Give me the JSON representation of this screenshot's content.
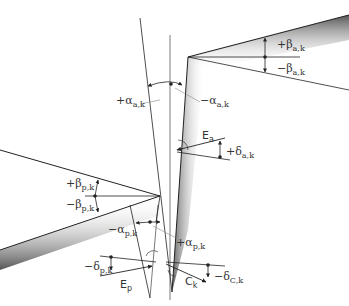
{
  "diagram": {
    "labels": {
      "beta_a_pos": {
        "sign": "+",
        "greek": "β",
        "sub": "a,k"
      },
      "beta_a_neg": {
        "sign": "−",
        "greek": "β",
        "sub": "a,k"
      },
      "alpha_a_pos": {
        "sign": "+",
        "greek": "α",
        "sub": "a,k"
      },
      "alpha_a_neg": {
        "sign": "−",
        "greek": "α",
        "sub": "a,k"
      },
      "E_a": {
        "main": "E",
        "sub": "a"
      },
      "delta_a_pos": {
        "sign": "+",
        "greek": "δ",
        "sub": "a,k"
      },
      "beta_p_pos": {
        "sign": "+",
        "greek": "β",
        "sub": "p,k"
      },
      "beta_p_neg": {
        "sign": "−",
        "greek": "β",
        "sub": "p,k"
      },
      "alpha_p_neg": {
        "sign": "−",
        "greek": "α",
        "sub": "p,k"
      },
      "alpha_p_pos": {
        "sign": "+",
        "greek": "α",
        "sub": "p,k"
      },
      "delta_p_neg": {
        "sign": "−",
        "greek": "δ",
        "sub": "p,k"
      },
      "E_p": {
        "main": "E",
        "sub": "p"
      },
      "C_k": {
        "main": "C",
        "sub": "k"
      },
      "delta_c_neg": {
        "sign": "−",
        "greek": "δ",
        "sub": "C,k"
      }
    },
    "colors": {
      "line": "#222222",
      "shade": "#888888",
      "text": "#333333"
    }
  }
}
